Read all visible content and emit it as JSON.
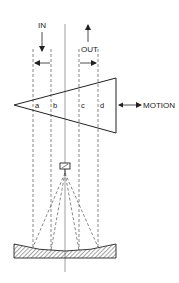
{
  "diagram": {
    "labels": {
      "in": "IN",
      "out": "OUT",
      "motion": "MOTION",
      "a": "a",
      "b": "b",
      "c": "c",
      "d": "d"
    },
    "elements": {
      "triangle": "moving wedge / sample",
      "source": "light source",
      "mirror": "concave mirror (hatched)",
      "axis": "center optical axis",
      "scan_lines": [
        "a",
        "b",
        "c",
        "d"
      ]
    },
    "colors": {
      "stroke": "#222222",
      "dashed": "#555555",
      "background": "#ffffff"
    }
  }
}
